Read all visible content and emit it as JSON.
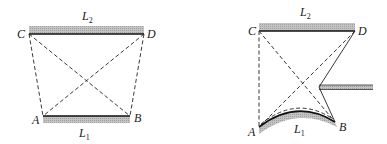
{
  "figure": {
    "colors": {
      "ink": "#111111",
      "hatch": "#b5b5b5",
      "background": "#ffffff"
    },
    "left_diagram": {
      "points": {
        "A": {
          "label": "A",
          "x": 43,
          "y": 116
        },
        "B": {
          "label": "B",
          "x": 130,
          "y": 116
        },
        "C": {
          "label": "C",
          "x": 29,
          "y": 34
        },
        "D": {
          "label": "D",
          "x": 144,
          "y": 34
        }
      },
      "bars": {
        "top": {
          "label": "L",
          "sub": "2"
        },
        "bottom": {
          "label": "L",
          "sub": "1"
        }
      },
      "solid_segments": [
        "CD",
        "AB"
      ],
      "dashed_segments": [
        "CA",
        "DB",
        "CB",
        "DA"
      ]
    },
    "right_diagram": {
      "points": {
        "A": {
          "label": "A",
          "x": 259,
          "y": 127
        },
        "B": {
          "label": "B",
          "x": 335,
          "y": 122
        },
        "C": {
          "label": "C",
          "x": 259,
          "y": 31
        },
        "D": {
          "label": "D",
          "x": 355,
          "y": 31
        }
      },
      "bars": {
        "top": {
          "label": "L",
          "sub": "2"
        },
        "bottom": {
          "label": "L",
          "sub": "1"
        }
      },
      "solid_segments": [
        "CD",
        "arc AB"
      ],
      "dashed_segments": [
        "CA",
        "CB",
        "DA",
        "D-notch",
        "notch-B",
        "arc AB (dashed)"
      ],
      "rod": {
        "side": "right",
        "notch_tip": {
          "x": 318,
          "y": 87
        }
      }
    }
  }
}
